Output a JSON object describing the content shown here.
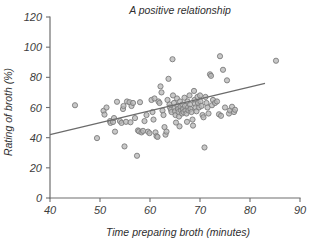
{
  "chart_data": {
    "type": "scatter",
    "title": "A positive relationship",
    "xlabel": "Time preparing broth (minutes)",
    "ylabel": "Rating of broth (%)",
    "xlim": [
      40,
      90
    ],
    "ylim": [
      0,
      120
    ],
    "xticks": [
      40,
      50,
      60,
      70,
      80,
      90
    ],
    "yticks": [
      0,
      20,
      40,
      60,
      80,
      100,
      120
    ],
    "xtick_labels": [
      "40",
      "50",
      "60",
      "70",
      "80",
      "90"
    ],
    "ytick_labels": [
      "0",
      "20",
      "40",
      "60",
      "80",
      "100",
      "120"
    ],
    "grid": false,
    "legend": null,
    "marker": {
      "shape": "circle",
      "radius_px": 2.6,
      "fill_color": "#b5b5b5",
      "edge_color": "#7c7c7c"
    },
    "trend_line": {
      "label": "linear fit",
      "color": "#6b6b6b",
      "x_start": 40,
      "y_start": 42.0,
      "x_end": 83,
      "y_end": 76.0
    },
    "points": [
      [
        45.0,
        61.5
      ],
      [
        49.4,
        39.7
      ],
      [
        50.7,
        57.8
      ],
      [
        50.9,
        55.3
      ],
      [
        51.3,
        60.0
      ],
      [
        52.0,
        51.0
      ],
      [
        52.1,
        49.8
      ],
      [
        52.6,
        50.4
      ],
      [
        52.8,
        53.0
      ],
      [
        53.0,
        44.0
      ],
      [
        53.4,
        63.8
      ],
      [
        54.0,
        51.0
      ],
      [
        54.3,
        49.8
      ],
      [
        54.6,
        59.0
      ],
      [
        54.7,
        61.0
      ],
      [
        54.9,
        34.2
      ],
      [
        55.2,
        50.5
      ],
      [
        55.4,
        64.0
      ],
      [
        55.9,
        63.5
      ],
      [
        56.1,
        50.2
      ],
      [
        56.3,
        61.0
      ],
      [
        56.6,
        63.0
      ],
      [
        57.0,
        53.0
      ],
      [
        57.4,
        28.0
      ],
      [
        57.6,
        44.8
      ],
      [
        57.8,
        44.2
      ],
      [
        58.0,
        63.5
      ],
      [
        58.3,
        43.5
      ],
      [
        58.6,
        44.5
      ],
      [
        58.9,
        51.0
      ],
      [
        59.3,
        55.0
      ],
      [
        59.6,
        44.0
      ],
      [
        59.9,
        43.0
      ],
      [
        60.3,
        65.0
      ],
      [
        60.5,
        57.0
      ],
      [
        60.7,
        52.0
      ],
      [
        60.9,
        66.0
      ],
      [
        61.1,
        43.5
      ],
      [
        61.3,
        41.0
      ],
      [
        61.5,
        40.5
      ],
      [
        61.7,
        64.0
      ],
      [
        61.9,
        63.0
      ],
      [
        62.1,
        74.0
      ],
      [
        62.3,
        70.0
      ],
      [
        62.5,
        58.0
      ],
      [
        62.7,
        55.0
      ],
      [
        62.9,
        47.0
      ],
      [
        63.1,
        42.0
      ],
      [
        63.3,
        44.0
      ],
      [
        63.5,
        65.0
      ],
      [
        63.7,
        79.0
      ],
      [
        63.9,
        62.0
      ],
      [
        64.0,
        60.0
      ],
      [
        64.2,
        58.5
      ],
      [
        64.3,
        57.0
      ],
      [
        64.5,
        92.0
      ],
      [
        64.6,
        68.0
      ],
      [
        64.8,
        63.0
      ],
      [
        64.9,
        59.5
      ],
      [
        65.0,
        57.5
      ],
      [
        65.1,
        55.0
      ],
      [
        65.2,
        50.0
      ],
      [
        65.4,
        66.0
      ],
      [
        65.5,
        61.0
      ],
      [
        65.6,
        59.0
      ],
      [
        65.7,
        57.0
      ],
      [
        65.8,
        54.0
      ],
      [
        65.9,
        47.5
      ],
      [
        66.0,
        64.0
      ],
      [
        66.1,
        60.5
      ],
      [
        66.2,
        58.0
      ],
      [
        66.4,
        56.0
      ],
      [
        66.5,
        62.0
      ],
      [
        66.6,
        59.0
      ],
      [
        66.7,
        57.0
      ],
      [
        66.9,
        66.5
      ],
      [
        67.0,
        61.0
      ],
      [
        67.1,
        58.0
      ],
      [
        67.3,
        56.0
      ],
      [
        67.4,
        50.5
      ],
      [
        67.5,
        64.0
      ],
      [
        67.6,
        60.0
      ],
      [
        67.7,
        58.0
      ],
      [
        67.9,
        68.0
      ],
      [
        68.0,
        62.0
      ],
      [
        68.1,
        59.0
      ],
      [
        68.3,
        57.0
      ],
      [
        68.5,
        52.0
      ],
      [
        68.6,
        48.0
      ],
      [
        68.8,
        71.0
      ],
      [
        68.9,
        65.0
      ],
      [
        69.0,
        62.5
      ],
      [
        69.1,
        60.0
      ],
      [
        69.3,
        57.5
      ],
      [
        69.5,
        67.0
      ],
      [
        69.6,
        63.0
      ],
      [
        69.8,
        60.0
      ],
      [
        70.0,
        68.0
      ],
      [
        70.1,
        64.0
      ],
      [
        70.3,
        61.0
      ],
      [
        70.5,
        55.0
      ],
      [
        70.7,
        53.5
      ],
      [
        70.9,
        33.5
      ],
      [
        71.1,
        67.0
      ],
      [
        71.3,
        63.0
      ],
      [
        71.5,
        60.0
      ],
      [
        71.7,
        56.0
      ],
      [
        72.0,
        82.0
      ],
      [
        72.2,
        81.0
      ],
      [
        72.4,
        61.5
      ],
      [
        72.6,
        65.0
      ],
      [
        73.0,
        63.0
      ],
      [
        73.4,
        64.0
      ],
      [
        73.8,
        55.5
      ],
      [
        74.0,
        94.0
      ],
      [
        74.2,
        54.5
      ],
      [
        74.6,
        85.0
      ],
      [
        75.0,
        60.0
      ],
      [
        75.4,
        78.0
      ],
      [
        75.8,
        56.0
      ],
      [
        76.0,
        58.0
      ],
      [
        76.4,
        60.5
      ],
      [
        76.8,
        57.0
      ],
      [
        77.0,
        58.5
      ],
      [
        85.2,
        91.0
      ]
    ]
  }
}
